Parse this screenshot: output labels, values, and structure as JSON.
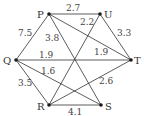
{
  "diagram": {
    "type": "weighted-undirected-graph",
    "nodes": [
      {
        "id": "P",
        "label": "P",
        "x": 49,
        "y": 14,
        "lx": 37,
        "ly": 18
      },
      {
        "id": "U",
        "label": "U",
        "x": 100,
        "y": 14,
        "lx": 104,
        "ly": 18
      },
      {
        "id": "Q",
        "label": "Q",
        "x": 16,
        "y": 60,
        "lx": 3,
        "ly": 64
      },
      {
        "id": "T",
        "label": "T",
        "x": 131,
        "y": 60,
        "lx": 134,
        "ly": 64
      },
      {
        "id": "R",
        "label": "R",
        "x": 49,
        "y": 105,
        "lx": 37,
        "ly": 110
      },
      {
        "id": "S",
        "label": "S",
        "x": 101,
        "y": 105,
        "lx": 105,
        "ly": 110
      }
    ],
    "edges": [
      {
        "from": "P",
        "to": "U",
        "weight": "2.7",
        "lx": 66,
        "ly": 11
      },
      {
        "from": "P",
        "to": "Q",
        "weight": "7.5",
        "lx": 18,
        "ly": 36
      },
      {
        "from": "P",
        "to": "S",
        "weight": "3.8",
        "lx": 45,
        "ly": 41
      },
      {
        "from": "P",
        "to": "T",
        "weight": "1.9",
        "lx": 94,
        "ly": 55
      },
      {
        "from": "U",
        "to": "R",
        "weight": "2.2",
        "lx": 80,
        "ly": 25
      },
      {
        "from": "U",
        "to": "T",
        "weight": "3.3",
        "lx": 117,
        "ly": 36
      },
      {
        "from": "Q",
        "to": "T",
        "weight": "1.9",
        "lx": 39,
        "ly": 58
      },
      {
        "from": "Q",
        "to": "S",
        "weight": "1.6",
        "lx": 41,
        "ly": 74
      },
      {
        "from": "Q",
        "to": "R",
        "weight": "3.5",
        "lx": 18,
        "ly": 86
      },
      {
        "from": "R",
        "to": "T",
        "weight": "2.6",
        "lx": 99,
        "ly": 84
      },
      {
        "from": "R",
        "to": "S",
        "weight": "4.1",
        "lx": 68,
        "ly": 115
      }
    ]
  }
}
